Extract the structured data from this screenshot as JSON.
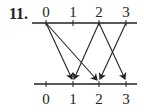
{
  "problem": {
    "number": "11."
  },
  "domain_line": {
    "labels": [
      "0",
      "1",
      "2",
      "3"
    ]
  },
  "codomain_line": {
    "labels": [
      "0",
      "1",
      "2",
      "3"
    ]
  },
  "mapping": [
    {
      "from": "0",
      "to": "1"
    },
    {
      "from": "0",
      "to": "2"
    },
    {
      "from": "2",
      "to": "1"
    },
    {
      "from": "2",
      "to": "3"
    },
    {
      "from": "3",
      "to": "2"
    }
  ],
  "colors": {
    "ink": "#222222",
    "background": "#ffffff"
  }
}
